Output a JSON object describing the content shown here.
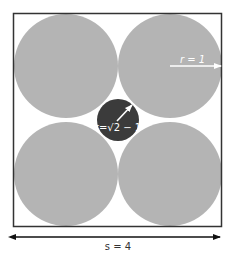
{
  "diagram": {
    "square": {
      "side_label": "s = 4",
      "stroke": "#333333"
    },
    "large_circles": {
      "count": 4,
      "radius_label": "r = 1",
      "fill": "#b4b4b4"
    },
    "small_circle": {
      "radius_label": "r=√2 − 1",
      "fill": "#3b3b3b"
    },
    "label_color": "#ffffff",
    "arrow_color": "#111111"
  }
}
